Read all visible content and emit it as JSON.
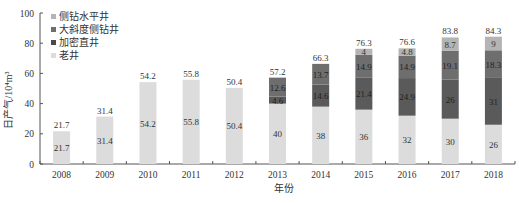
{
  "chart_data": {
    "type": "bar",
    "stacked": true,
    "title": "",
    "xlabel": "年份",
    "ylabel": "日产气/10⁴m³",
    "ylim": [
      0,
      100
    ],
    "yticks": [
      0,
      20,
      40,
      60,
      80,
      100
    ],
    "grid": false,
    "legend_position": "top-left inside",
    "categories": [
      "2008",
      "2009",
      "2010",
      "2011",
      "2012",
      "2013",
      "2014",
      "2015",
      "2016",
      "2017",
      "2018"
    ],
    "series": [
      {
        "name": "老井",
        "color": "#dcdcdc",
        "values": [
          21.7,
          31.4,
          54.2,
          55.8,
          50.4,
          40,
          38,
          36,
          32,
          30,
          26
        ]
      },
      {
        "name": "加密直井",
        "color": "#5a5a5a",
        "values": [
          0,
          0,
          0,
          0,
          0,
          4.6,
          14.6,
          21.4,
          24.9,
          26,
          31
        ]
      },
      {
        "name": "大斜度侧钻井",
        "color": "#6e6e6e",
        "values": [
          0,
          0,
          0,
          0,
          0,
          12.6,
          13.7,
          14.9,
          14.9,
          19.1,
          18.3
        ]
      },
      {
        "name": "侧钻水平井",
        "color": "#b4b4b4",
        "values": [
          0,
          0,
          0,
          0,
          0,
          0,
          0,
          4,
          4.8,
          8.7,
          9
        ]
      }
    ],
    "totals": [
      21.7,
      31.4,
      54.2,
      55.8,
      50.4,
      57.2,
      66.3,
      76.3,
      76.6,
      83.8,
      84.3
    ]
  },
  "legend": [
    {
      "label": "侧钻水平井",
      "color": "#b4b4b4"
    },
    {
      "label": "大斜度侧钻井",
      "color": "#6e6e6e"
    },
    {
      "label": "加密直井",
      "color": "#4a4a4a"
    },
    {
      "label": "老井",
      "color": "#dcdcdc"
    }
  ]
}
